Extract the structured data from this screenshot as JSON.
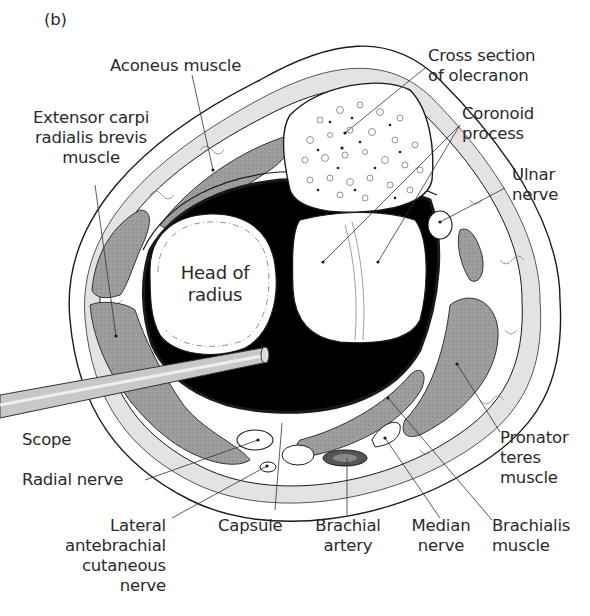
{
  "figure": {
    "panel_label": "(b)",
    "labels": {
      "aconeus": "Aconeus muscle",
      "ecrb": "Extensor carpi\nradialis brevis\nmuscle",
      "olecranon": "Cross section\nof olecranon",
      "coronoid": "Coronoid\nprocess",
      "ulnar_nerve": "Ulnar\nnerve",
      "head_radius": "Head of\nradius",
      "scope": "Scope",
      "radial_nerve": "Radial nerve",
      "lateral_antebrachial": "Lateral\nantebrachial\ncutaneous\nnerve",
      "capsule": "Capsule",
      "brachial_artery": "Brachial\nartery",
      "median_nerve": "Median\nnerve",
      "brachialis": "Brachialis\nmuscle",
      "pronator_teres": "Pronator\nteres\nmuscle"
    },
    "colors": {
      "ink": "#1a1a1a",
      "muscle": "#9a9a9a",
      "fat": "#e3e3e3",
      "joint_space": "#000000",
      "scope": "#c8c8c8",
      "artery": "#555555"
    }
  }
}
